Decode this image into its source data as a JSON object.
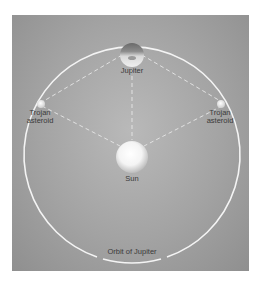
{
  "diagram": {
    "bodies": [
      {
        "id": "jupiter",
        "label": "Jupiter"
      },
      {
        "id": "trojan-left",
        "label_line1": "Trojan",
        "label_line2": "asteroid"
      },
      {
        "id": "trojan-right",
        "label_line1": "Trojan",
        "label_line2": "asteroid"
      },
      {
        "id": "sun",
        "label": "Sun"
      }
    ],
    "orbit_label": "Orbit of Jupiter",
    "colors": {
      "background": "#a3a3a3",
      "orbit": "#f2f2f2",
      "dashed_lines": "#e0e0e0",
      "label_text": "#3a3a3a"
    }
  }
}
